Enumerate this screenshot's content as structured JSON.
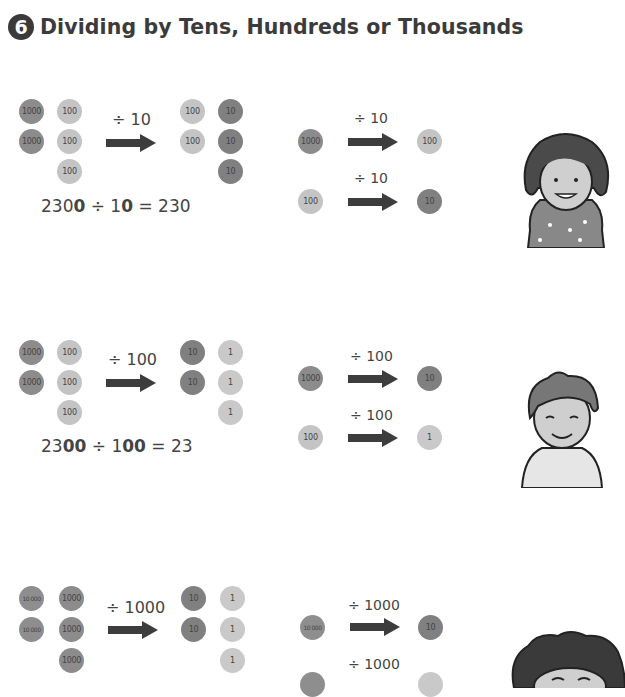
{
  "header": {
    "section_number": "6",
    "title": "Dividing by Tens, Hundreds or Thousands"
  },
  "sections": [
    {
      "divisor_label": "÷ 10",
      "left_coins": [
        [
          "1000",
          "1000"
        ],
        [
          "100",
          "100",
          "100"
        ]
      ],
      "right_coins": [
        [
          "100",
          "100"
        ],
        [
          "10",
          "10",
          "10"
        ]
      ],
      "equation": {
        "a_plain": "230",
        "a_bold": "0",
        "op": " ÷ ",
        "b_plain": "1",
        "b_bold": "0",
        "result": " = 230"
      },
      "examples": [
        {
          "from": "1000",
          "op": "÷ 10",
          "to": "100"
        },
        {
          "from": "100",
          "op": "÷ 10",
          "to": "10"
        }
      ],
      "character": "girl-short-hair"
    },
    {
      "divisor_label": "÷ 100",
      "left_coins": [
        [
          "1000",
          "1000"
        ],
        [
          "100",
          "100",
          "100"
        ]
      ],
      "right_coins": [
        [
          "10",
          "10"
        ],
        [
          "1",
          "1",
          "1"
        ]
      ],
      "equation": {
        "a_plain": "23",
        "a_bold": "00",
        "op": " ÷ ",
        "b_plain": "1",
        "b_bold": "00",
        "result": " = 23"
      },
      "examples": [
        {
          "from": "1000",
          "op": "÷ 100",
          "to": "10"
        },
        {
          "from": "100",
          "op": "÷ 100",
          "to": "1"
        }
      ],
      "character": "boy"
    },
    {
      "divisor_label": "÷ 1000",
      "left_coins": [
        [
          "10 000",
          "10 000"
        ],
        [
          "1000",
          "1000",
          "1000"
        ]
      ],
      "right_coins": [
        [
          "10",
          "10"
        ],
        [
          "1",
          "1",
          "1"
        ]
      ],
      "examples": [
        {
          "from": "10 000",
          "op": "÷ 1000",
          "to": "10"
        },
        {
          "from": "",
          "op": "÷ 1000",
          "to": ""
        }
      ],
      "character": "girl-curly-hair"
    }
  ]
}
